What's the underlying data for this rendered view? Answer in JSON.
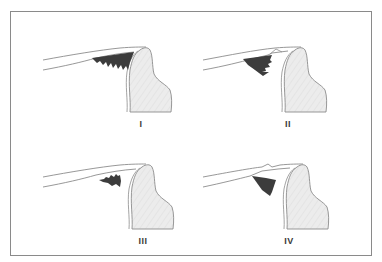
{
  "figure": {
    "frame_color": "#8a8a8a",
    "tooth_fill": "#ececec",
    "tooth_outline": "#8c8c8c",
    "deposit_color": "#3c3c3c",
    "lip_line_color": "#8c8c8c",
    "panels": [
      {
        "id": "I",
        "label": "I",
        "description": "deposit filling space beneath margin, jagged lower edge, contacting tooth"
      },
      {
        "id": "II",
        "label": "II",
        "description": "deposit beneath margin, separated from tooth by small notch in upper line"
      },
      {
        "id": "III",
        "label": "III",
        "description": "small isolated jagged deposit, not contacting margin"
      },
      {
        "id": "IV",
        "label": "IV",
        "description": "wedge-shaped deposit, upper line shows small kinks/fracture"
      }
    ]
  }
}
